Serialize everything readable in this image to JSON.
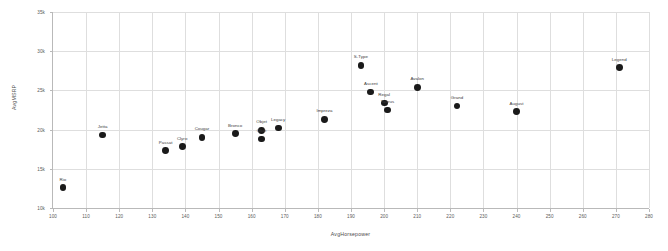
{
  "chart_data": {
    "type": "scatter",
    "title": "",
    "xlabel": "AvgHorsepower",
    "ylabel": "AvgMSRP",
    "xlim": [
      100,
      280
    ],
    "ylim": [
      10000,
      35000
    ],
    "xticks": [
      100,
      110,
      120,
      130,
      140,
      150,
      160,
      170,
      180,
      190,
      200,
      210,
      220,
      230,
      240,
      250,
      260,
      270,
      280
    ],
    "xticklabels": [
      "100",
      "110",
      "120",
      "130",
      "140",
      "150",
      "160",
      "170",
      "180",
      "190",
      "200",
      "210",
      "220",
      "230",
      "240",
      "250",
      "260",
      "270",
      "280"
    ],
    "yticks": [
      10000,
      15000,
      20000,
      25000,
      30000,
      35000
    ],
    "yticklabels": [
      "10k",
      "15k",
      "20k",
      "25k",
      "30k",
      "35k"
    ],
    "grid": true,
    "legend": false,
    "marker_color": "#1a1a1a",
    "points": [
      {
        "label": "Rio",
        "x": 103,
        "y": 12600
      },
      {
        "label": "Jetta",
        "x": 115,
        "y": 19300
      },
      {
        "label": "Passat",
        "x": 134,
        "y": 17300
      },
      {
        "label": "Clyro",
        "x": 139,
        "y": 17800
      },
      {
        "label": "Cougar",
        "x": 145,
        "y": 19000
      },
      {
        "label": "Bronco",
        "x": 155,
        "y": 19500
      },
      {
        "label": "Objet",
        "x": 163,
        "y": 19900
      },
      {
        "label": "Okot",
        "x": 163,
        "y": 18800
      },
      {
        "label": "Legacy",
        "x": 168,
        "y": 20200
      },
      {
        "label": "Impreza",
        "x": 182,
        "y": 21300
      },
      {
        "label": "S-Type",
        "x": 193,
        "y": 28200
      },
      {
        "label": "Ascent",
        "x": 196,
        "y": 24800
      },
      {
        "label": "Regal",
        "x": 200,
        "y": 23400
      },
      {
        "label": "Taurus",
        "x": 201,
        "y": 22500
      },
      {
        "label": "Avalon",
        "x": 210,
        "y": 25400
      },
      {
        "label": "Grand",
        "x": 222,
        "y": 23000
      },
      {
        "label": "August",
        "x": 240,
        "y": 22300
      },
      {
        "label": "Legend",
        "x": 271,
        "y": 27900
      }
    ]
  }
}
